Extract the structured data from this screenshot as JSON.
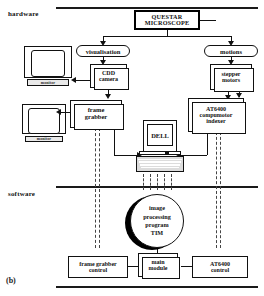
{
  "figure": {
    "panel_label": "(b)",
    "sections": [
      {
        "label": "hardware"
      },
      {
        "label": "software"
      }
    ]
  },
  "hardware": {
    "questar": "QUESTAR MICROSCOPE",
    "questar_line1": "QUESTAR",
    "questar_line2": "MICROSCOPE",
    "branches": [
      {
        "label": "visualisation"
      },
      {
        "label": "motions"
      }
    ],
    "nodes": {
      "cdd_camera_line1": "CDD",
      "cdd_camera_line2": "camera",
      "stepper_line1": "stepper",
      "stepper_line2": "motors",
      "frame_grabber_line1": "frame",
      "frame_grabber_line2": "grabber",
      "at6400_line1": "AT6400",
      "at6400_line2": "compumotor",
      "at6400_line3": "indexer",
      "computer": "DELL"
    },
    "monitors": [
      {
        "label": "monitor"
      },
      {
        "label": "monitor"
      }
    ]
  },
  "software": {
    "program": {
      "line1": "image",
      "line2": "processing",
      "line3": "program",
      "line4": "TIM"
    },
    "modules": [
      {
        "line1": "frame grabber",
        "line2": "control"
      },
      {
        "line1": "main",
        "line2": "module"
      },
      {
        "line1": "AT6400",
        "line2": "control"
      }
    ]
  },
  "colors": {
    "ink": "#111111",
    "paper": "#ffffff",
    "shadow": "#000000"
  }
}
